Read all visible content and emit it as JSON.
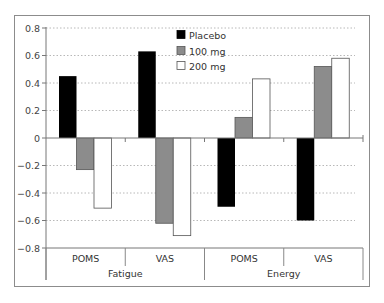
{
  "chart_data": {
    "type": "bar",
    "title": "",
    "xlabel": "",
    "ylabel": "",
    "groups": [
      {
        "label": "Fatigue",
        "categories": [
          "POMS",
          "VAS"
        ]
      },
      {
        "label": "Energy",
        "categories": [
          "POMS",
          "VAS"
        ]
      }
    ],
    "categories": [
      "Fatigue POMS",
      "Fatigue VAS",
      "Energy POMS",
      "Energy VAS"
    ],
    "series": [
      {
        "name": "Placebo",
        "color": "#000000",
        "values": [
          0.45,
          0.63,
          -0.5,
          -0.6
        ]
      },
      {
        "name": "100 mg",
        "color": "#8c8c8c",
        "values": [
          -0.23,
          -0.62,
          0.15,
          0.52
        ]
      },
      {
        "name": "200 mg",
        "color": "#ffffff",
        "values": [
          -0.51,
          -0.71,
          0.43,
          0.58
        ]
      }
    ],
    "ylim": [
      -0.8,
      0.8
    ],
    "yticks": [
      "0.8",
      "0.6",
      "0.4",
      "0.2",
      "0",
      "-0.2",
      "-0.4",
      "-0.6",
      "-0.8"
    ],
    "grid": "horizontal dotted",
    "legend_position": "top center inside plot"
  },
  "legend": [
    {
      "label": "Placebo"
    },
    {
      "label": "100 mg"
    },
    {
      "label": "200 mg"
    }
  ],
  "x_axis": {
    "sub_labels": [
      "POMS",
      "VAS",
      "POMS",
      "VAS"
    ],
    "group_labels": [
      "Fatigue",
      "Energy"
    ]
  }
}
